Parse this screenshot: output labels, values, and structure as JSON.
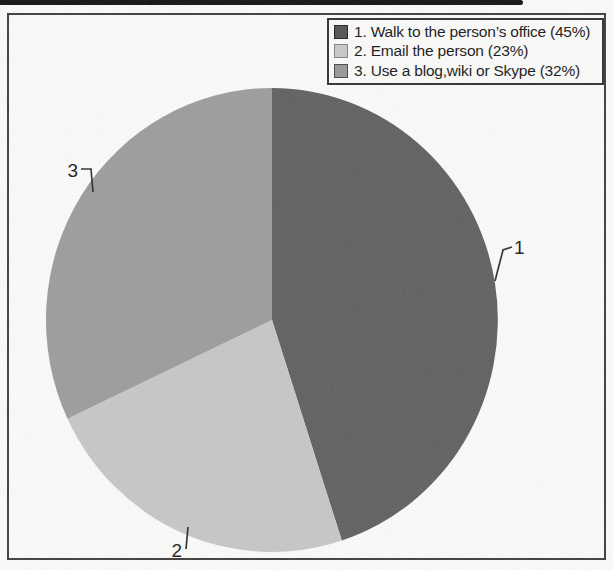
{
  "chart_data": {
    "type": "pie",
    "title": "",
    "categories": [
      "Walk to the person’s office",
      "Email the person",
      "Use a blog,wiki or Skype"
    ],
    "values": [
      45,
      23,
      32
    ],
    "unit": "%",
    "start_angle_deg": 0,
    "direction": "clockwise",
    "legend_position": "top-right",
    "slice_colors": [
      "#5f5f5f",
      "#c7c7c7",
      "#9c9c9c"
    ],
    "slice_callout_numbers": [
      "1",
      "2",
      "3"
    ]
  },
  "legend": {
    "items": [
      {
        "label": "1. Walk to the person’s office (45%)",
        "swatch_color": "#525252",
        "swatch_border": "#1f1f1f"
      },
      {
        "label": "2. Email the person (23%)",
        "swatch_color": "#c9c9c9",
        "swatch_border": "#808080"
      },
      {
        "label": "3. Use a blog,wiki or Skype (32%)",
        "swatch_color": "#989898",
        "swatch_border": "#474747"
      }
    ]
  }
}
